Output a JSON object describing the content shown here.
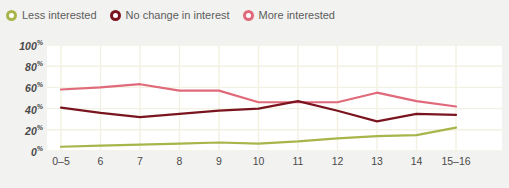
{
  "legend": {
    "position": "top-left",
    "items": [
      {
        "label": "Less interested",
        "color": "#a8b54a",
        "marker": "ring-marker-icon"
      },
      {
        "label": "No change in interest",
        "color": "#7a1520",
        "marker": "ring-marker-icon"
      },
      {
        "label": "More interested",
        "color": "#e0697a",
        "marker": "ring-marker-icon"
      }
    ]
  },
  "chart_data": {
    "type": "line",
    "title": "",
    "xlabel": "",
    "ylabel": "",
    "categories": [
      "0–5",
      "6",
      "7",
      "8",
      "9",
      "10",
      "11",
      "12",
      "13",
      "14",
      "15–16"
    ],
    "ylim": [
      0,
      100
    ],
    "ytick_labels": [
      "100%",
      "80%",
      "60%",
      "40%",
      "20%",
      "0%"
    ],
    "ytick_values": [
      100,
      80,
      60,
      40,
      20,
      0
    ],
    "grid": true,
    "series": [
      {
        "name": "More interested",
        "color": "#e0697a",
        "values": [
          58,
          60,
          63,
          57,
          57,
          46,
          46,
          46,
          55,
          47,
          42
        ]
      },
      {
        "name": "No change in interest",
        "color": "#7a1520",
        "values": [
          41,
          36,
          32,
          35,
          38,
          40,
          47,
          38,
          28,
          35,
          34
        ]
      },
      {
        "name": "Less interested",
        "color": "#a8b54a",
        "values": [
          4,
          5,
          6,
          7,
          8,
          7,
          9,
          12,
          14,
          15,
          22
        ]
      }
    ]
  }
}
